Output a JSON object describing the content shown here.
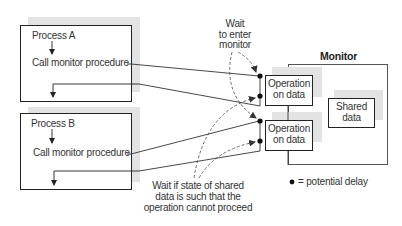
{
  "processes": [
    {
      "name": "Process A",
      "call_label": "Call monitor procedure"
    },
    {
      "name": "Process B",
      "call_label": "Call monitor procedure"
    }
  ],
  "monitor": {
    "title": "Monitor",
    "operations": [
      {
        "label_line1": "Operation",
        "label_line2": "on data"
      },
      {
        "label_line1": "Operation",
        "label_line2": "on data"
      }
    ],
    "shared_data": {
      "line1": "Shared",
      "line2": "data"
    }
  },
  "annotations": {
    "wait_enter": {
      "line1": "Wait",
      "line2": "to enter",
      "line3": "monitor"
    },
    "wait_state": {
      "line1": "Wait if state of shared",
      "line2": "data is such that the",
      "line3": "operation cannot proceed"
    }
  },
  "legend": {
    "symbol": "●",
    "text": "= potential delay"
  },
  "colors": {
    "shadow": "#e3e3e3",
    "stroke": "#222222",
    "text": "#333333"
  }
}
